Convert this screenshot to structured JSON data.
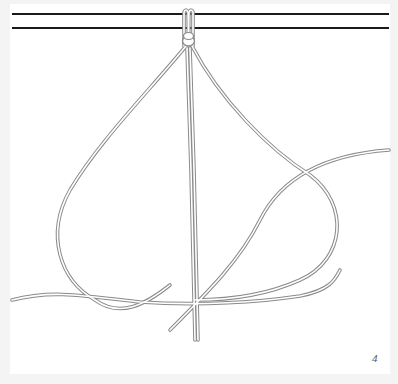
{
  "figure": {
    "type": "knot-tying step illustration",
    "step_number": "4",
    "colors": {
      "background": "#f4f4f4",
      "panel": "#ffffff",
      "bar": "#1a1a1a",
      "cord_outline": "#8a8a8a",
      "cord_fill": "#ffffff"
    }
  }
}
